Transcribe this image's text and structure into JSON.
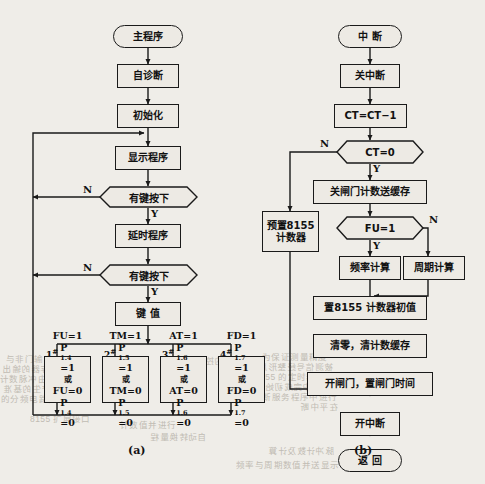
{
  "figure": {
    "caption_a": "(a)",
    "caption_b": "(b)",
    "background_color": "#efede8",
    "line_color": "#1a1a1a",
    "node_fill": "#edeae4"
  },
  "flowchart_a": {
    "title": "主程序流程图",
    "nodes": [
      {
        "id": "a_start",
        "type": "terminator",
        "text": "主程序"
      },
      {
        "id": "a_self",
        "type": "process",
        "text": "自诊断"
      },
      {
        "id": "a_init",
        "type": "process",
        "text": "初始化"
      },
      {
        "id": "a_disp",
        "type": "process",
        "text": "显示程序"
      },
      {
        "id": "a_key1",
        "type": "decision",
        "text": "有键按下"
      },
      {
        "id": "a_delay",
        "type": "process",
        "text": "延时程序"
      },
      {
        "id": "a_key2",
        "type": "decision",
        "text": "有键按下"
      },
      {
        "id": "a_keyval",
        "type": "process",
        "text": "键  值"
      }
    ],
    "branch_labels": {
      "no": "N",
      "yes": "Y"
    },
    "key_branches": [
      {
        "tag": "1",
        "tag_sup": "#",
        "lines": [
          "FU=1",
          "P1.4=1",
          "或",
          "FU=0",
          "P1.4=0"
        ]
      },
      {
        "tag": "2",
        "tag_sup": "#",
        "lines": [
          "TM=1",
          "P1.5=1",
          "或",
          "TM=0",
          "P1.5=0"
        ]
      },
      {
        "tag": "3",
        "tag_sup": "#",
        "lines": [
          "AT=1",
          "P1.6=1",
          "或",
          "AT=0",
          "P1.6=0"
        ]
      },
      {
        "tag": "4",
        "tag_sup": "#",
        "lines": [
          "FD=1",
          "P1.7=1",
          "或",
          "FD=0",
          "P1.7=0"
        ]
      }
    ]
  },
  "flowchart_b": {
    "title": "中断服务程序流程图",
    "nodes": [
      {
        "id": "b_start",
        "type": "terminator",
        "text": "中  断"
      },
      {
        "id": "b_dis",
        "type": "process",
        "text": "关中断"
      },
      {
        "id": "b_dec",
        "type": "process",
        "text": "CT=CT−1"
      },
      {
        "id": "b_ct0",
        "type": "decision",
        "text": "CT=0"
      },
      {
        "id": "b_preset",
        "type": "process",
        "text": "预置8155\n计数器"
      },
      {
        "id": "b_gate",
        "type": "process",
        "text": "关闸门计数送缓存"
      },
      {
        "id": "b_fu",
        "type": "decision",
        "text": "FU=1"
      },
      {
        "id": "b_freq",
        "type": "process",
        "text": "频率计算"
      },
      {
        "id": "b_period",
        "type": "process",
        "text": "周期计算"
      },
      {
        "id": "b_setinit",
        "type": "process",
        "text": "置8155 计数器初值"
      },
      {
        "id": "b_clear",
        "type": "process",
        "text": "清零，清计数缓存"
      },
      {
        "id": "b_open",
        "type": "process",
        "text": "开闸门，置闸门时间"
      },
      {
        "id": "b_en",
        "type": "process",
        "text": "开中断"
      },
      {
        "id": "b_ret",
        "type": "terminator",
        "text": "返  回"
      }
    ],
    "branch_labels": {
      "no": "N",
      "yes": "Y"
    }
  },
  "artifacts": [
    {
      "text": "与非门输出",
      "x": 6,
      "y": 352
    },
    {
      "text": "数据锁存器的输出",
      "x": 2,
      "y": 362
    },
    {
      "text": "计数脉冲由闸门控制",
      "x": 0,
      "y": 372
    },
    {
      "text": "时钟电路产生的基准",
      "x": 3,
      "y": 382
    },
    {
      "text": "的分频电路，可产生",
      "x": 1,
      "y": 392
    },
    {
      "text": "显示器的控制信号",
      "x": 176,
      "y": 354
    },
    {
      "text": "为保证测量精度",
      "x": 262,
      "y": 350
    },
    {
      "text": "被测信号经整形后",
      "x": 258,
      "y": 360
    },
    {
      "text": "8155 的定时器作为",
      "x": 255,
      "y": 370
    },
    {
      "text": "主程序中完成初始化",
      "x": 255,
      "y": 380
    },
    {
      "text": "中断服务程序中进行",
      "x": 253,
      "y": 390
    },
    {
      "text": "在平中断",
      "x": 300,
      "y": 400
    },
    {
      "text": "频率与周期数值并送显示",
      "x": 236,
      "y": 458
    },
    {
      "text": "脉冲计数及计算",
      "x": 268,
      "y": 444
    },
    {
      "text": "计数值并进行",
      "x": 120,
      "y": 418
    },
    {
      "text": "自动转换量程",
      "x": 150,
      "y": 430
    },
    {
      "text": "8155 扩展接口",
      "x": 30,
      "y": 412
    }
  ]
}
